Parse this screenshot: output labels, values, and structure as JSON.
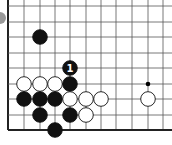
{
  "diagram": {
    "type": "go-board-fragment",
    "grid": {
      "x_lines": [
        8,
        24,
        40,
        55,
        70,
        86,
        101,
        116,
        132,
        148,
        163
      ],
      "y_lines": [
        6,
        22,
        37,
        53,
        68,
        84,
        99,
        115,
        130
      ],
      "left_edge_x": 8,
      "bottom_edge_y": 130,
      "line_color": "#555555",
      "edge_color": "#222222"
    },
    "star_points": [
      {
        "x": 148,
        "y": 84
      }
    ],
    "stones": [
      {
        "color": "black",
        "x": 40,
        "y": 37
      },
      {
        "color": "black",
        "x": 70,
        "y": 68,
        "label": "1"
      },
      {
        "color": "white",
        "x": 24,
        "y": 84
      },
      {
        "color": "white",
        "x": 40,
        "y": 84
      },
      {
        "color": "white",
        "x": 55,
        "y": 84
      },
      {
        "color": "black",
        "x": 70,
        "y": 84
      },
      {
        "color": "black",
        "x": 24,
        "y": 99
      },
      {
        "color": "black",
        "x": 40,
        "y": 99
      },
      {
        "color": "black",
        "x": 55,
        "y": 99
      },
      {
        "color": "white",
        "x": 70,
        "y": 99
      },
      {
        "color": "white",
        "x": 86,
        "y": 99
      },
      {
        "color": "white",
        "x": 101,
        "y": 99
      },
      {
        "color": "white",
        "x": 148,
        "y": 99
      },
      {
        "color": "black",
        "x": 40,
        "y": 115
      },
      {
        "color": "black",
        "x": 70,
        "y": 115
      },
      {
        "color": "white",
        "x": 86,
        "y": 115
      },
      {
        "color": "black",
        "x": 55,
        "y": 130
      }
    ],
    "move_label": "1",
    "corner_fragment": {
      "x": 0,
      "y": 18,
      "color": "#999999"
    }
  }
}
